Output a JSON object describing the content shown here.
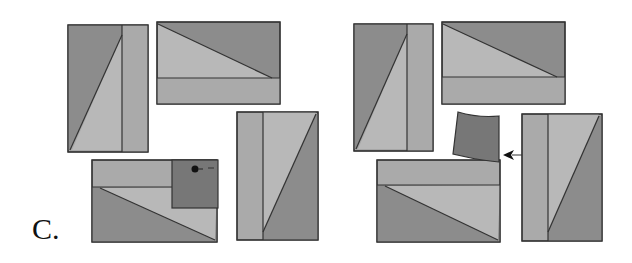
{
  "figure": {
    "label": "C.",
    "colors": {
      "dark": "#8c8c8c",
      "mid": "#a6a6a6",
      "light": "#b8b8b8",
      "tab": "#777777",
      "stroke": "#333333",
      "background": "#ffffff"
    },
    "panels": [
      {
        "name": "left-group",
        "description": "Four rectangles arranged in a pinwheel; bottom rectangle has a dark square flap with a dot"
      },
      {
        "name": "right-group",
        "description": "Same pinwheel arrangement; the dark flap is lifted off with an arrow pointing toward it"
      }
    ],
    "annotations": {
      "arrow": "left-pointing arrow",
      "dot": "filled dot marker"
    }
  }
}
